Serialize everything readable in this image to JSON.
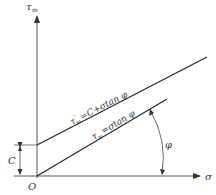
{
  "diagram": {
    "y_axis_label": "τ",
    "y_axis_sub": "m",
    "x_axis_label": "σ",
    "origin_label": "O",
    "intercept_label": "C",
    "angle_label": "φ",
    "upper_line_label": {
      "tau": "τ",
      "sup": "″",
      "sub": "m",
      "rest": "=C+σtan φ"
    },
    "lower_line_label": {
      "tau": "τ",
      "sup": "′",
      "sub": "m",
      "rest": "=σtan φ"
    },
    "colors": {
      "line": "#222222",
      "axis": "#444444",
      "text": "#333333"
    }
  }
}
